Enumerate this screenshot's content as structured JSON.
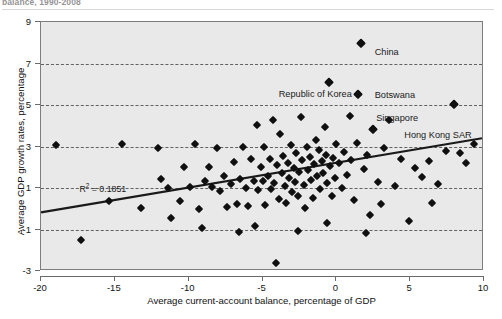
{
  "figure": {
    "title_partial": "balance, 1990-2008",
    "r2_label": "R",
    "r2_sup": "2",
    "r2_value": " = 0.1851"
  },
  "chart_data": {
    "type": "scatter",
    "title": "",
    "xlabel": "Average current-account balance, percentage of GDP",
    "ylabel": "Average GDP growth rates, percentage",
    "xlim": [
      -20,
      10
    ],
    "ylim": [
      -3,
      9
    ],
    "xticks": [
      -20,
      -15,
      -10,
      -5,
      0,
      5,
      10
    ],
    "xtick_labels": [
      "-20",
      "-15",
      "-10",
      "-5",
      "0",
      "5",
      "10"
    ],
    "yticks": [
      -3,
      -1,
      1,
      3,
      5,
      7,
      9
    ],
    "ytick_labels": [
      "-3",
      "-1",
      "1",
      "3",
      "5",
      "7",
      "9"
    ],
    "gridlines_y": [
      -1,
      1,
      3,
      5,
      7
    ],
    "grid": true,
    "grid_style": "dashed-horizontal",
    "legend": false,
    "marker": "diamond",
    "marker_color": "#101010",
    "plot_bg_color": "#e9e9e9",
    "trendline": {
      "type": "linear",
      "x_start": -20,
      "y_start": -0.25,
      "x_end": 10,
      "y_end": 3.35,
      "color": "#1a1a1a",
      "r_squared": 0.1851
    },
    "annotations": [
      {
        "text": "China",
        "x": 2.6,
        "y": 7.55,
        "point_x": 1.7,
        "point_y": 8.0
      },
      {
        "text": "Republic of Korea",
        "x": -3.9,
        "y": 5.55,
        "point_x": -0.5,
        "point_y": 6.1
      },
      {
        "text": "Botswana",
        "x": 2.6,
        "y": 5.5,
        "point_x": 1.5,
        "point_y": 5.55
      },
      {
        "text": "Singapore",
        "x": 2.7,
        "y": 4.35,
        "point_x": 2.5,
        "point_y": 3.85
      },
      {
        "text": "Hong Kong SAR",
        "x": 4.6,
        "y": 3.55,
        "point_x": 8.0,
        "point_y": 5.05
      }
    ],
    "points": [
      {
        "x": -19.0,
        "y": 3.05
      },
      {
        "x": -17.3,
        "y": -1.5
      },
      {
        "x": -14.5,
        "y": 3.1
      },
      {
        "x": -12.1,
        "y": 2.95
      },
      {
        "x": -11.9,
        "y": 1.45
      },
      {
        "x": -11.4,
        "y": 1.0
      },
      {
        "x": -11.2,
        "y": -0.45
      },
      {
        "x": -10.6,
        "y": 0.35
      },
      {
        "x": -10.3,
        "y": 2.0
      },
      {
        "x": -9.9,
        "y": 1.05
      },
      {
        "x": -9.6,
        "y": 3.1
      },
      {
        "x": -9.3,
        "y": 0.0
      },
      {
        "x": -8.9,
        "y": 1.35
      },
      {
        "x": -8.6,
        "y": 2.0
      },
      {
        "x": -8.4,
        "y": 1.05
      },
      {
        "x": -8.1,
        "y": 2.95
      },
      {
        "x": -7.9,
        "y": 0.85
      },
      {
        "x": -7.6,
        "y": 1.6
      },
      {
        "x": -7.4,
        "y": 0.1
      },
      {
        "x": -7.1,
        "y": 1.2
      },
      {
        "x": -6.9,
        "y": 2.25
      },
      {
        "x": -6.7,
        "y": 0.25
      },
      {
        "x": -6.5,
        "y": 1.45
      },
      {
        "x": -6.3,
        "y": 3.0
      },
      {
        "x": -6.1,
        "y": 1.0
      },
      {
        "x": -6.0,
        "y": 0.15
      },
      {
        "x": -5.8,
        "y": 2.4
      },
      {
        "x": -5.6,
        "y": 1.35
      },
      {
        "x": -5.4,
        "y": 4.05
      },
      {
        "x": -5.3,
        "y": 0.9
      },
      {
        "x": -5.1,
        "y": 2.0
      },
      {
        "x": -5.0,
        "y": 1.35
      },
      {
        "x": -4.9,
        "y": 3.0
      },
      {
        "x": -4.8,
        "y": 0.2
      },
      {
        "x": -4.6,
        "y": 1.6
      },
      {
        "x": -4.5,
        "y": 2.4
      },
      {
        "x": -4.4,
        "y": 0.95
      },
      {
        "x": -4.3,
        "y": 4.3
      },
      {
        "x": -4.2,
        "y": 1.25
      },
      {
        "x": -4.1,
        "y": -2.6
      },
      {
        "x": -4.0,
        "y": 2.1
      },
      {
        "x": -3.9,
        "y": 0.45
      },
      {
        "x": -3.8,
        "y": 3.6
      },
      {
        "x": -3.7,
        "y": 1.7
      },
      {
        "x": -3.6,
        "y": 2.55
      },
      {
        "x": -3.5,
        "y": 1.1
      },
      {
        "x": -3.4,
        "y": 0.3
      },
      {
        "x": -3.3,
        "y": 2.2
      },
      {
        "x": -3.2,
        "y": 1.5
      },
      {
        "x": -3.1,
        "y": 3.05
      },
      {
        "x": -3.0,
        "y": 0.8
      },
      {
        "x": -2.9,
        "y": 1.95
      },
      {
        "x": -2.8,
        "y": 1.3
      },
      {
        "x": -2.7,
        "y": 2.7
      },
      {
        "x": -2.6,
        "y": 0.6
      },
      {
        "x": -2.5,
        "y": 1.75
      },
      {
        "x": -2.4,
        "y": 4.4
      },
      {
        "x": -2.3,
        "y": 2.35
      },
      {
        "x": -2.2,
        "y": 1.15
      },
      {
        "x": -2.1,
        "y": 0.05
      },
      {
        "x": -2.0,
        "y": 3.0
      },
      {
        "x": -1.9,
        "y": 1.85
      },
      {
        "x": -1.8,
        "y": 2.5
      },
      {
        "x": -1.7,
        "y": 1.4
      },
      {
        "x": -1.6,
        "y": 0.5
      },
      {
        "x": -1.5,
        "y": 2.15
      },
      {
        "x": -1.4,
        "y": 3.3
      },
      {
        "x": -1.3,
        "y": 1.6
      },
      {
        "x": -1.2,
        "y": 2.85
      },
      {
        "x": -1.1,
        "y": 0.95
      },
      {
        "x": -1.0,
        "y": 2.3
      },
      {
        "x": -0.9,
        "y": 1.7
      },
      {
        "x": -0.8,
        "y": 3.95
      },
      {
        "x": -0.7,
        "y": 2.6
      },
      {
        "x": -0.6,
        "y": 1.25
      },
      {
        "x": -0.5,
        "y": 6.1
      },
      {
        "x": -0.4,
        "y": 2.05
      },
      {
        "x": -0.3,
        "y": 0.6
      },
      {
        "x": -0.2,
        "y": 2.45
      },
      {
        "x": -0.1,
        "y": 1.5
      },
      {
        "x": 0.0,
        "y": 3.1
      },
      {
        "x": 0.2,
        "y": 2.2
      },
      {
        "x": 0.4,
        "y": 1.0
      },
      {
        "x": 0.5,
        "y": 2.75
      },
      {
        "x": 0.7,
        "y": 1.65
      },
      {
        "x": 0.9,
        "y": 4.45
      },
      {
        "x": 1.0,
        "y": 2.35
      },
      {
        "x": 1.2,
        "y": 0.4
      },
      {
        "x": 1.4,
        "y": 3.15
      },
      {
        "x": 1.5,
        "y": 5.55
      },
      {
        "x": 1.7,
        "y": 8.0
      },
      {
        "x": 1.9,
        "y": 1.9
      },
      {
        "x": 2.1,
        "y": 2.6
      },
      {
        "x": 2.3,
        "y": -0.3
      },
      {
        "x": 2.5,
        "y": 3.85
      },
      {
        "x": 2.8,
        "y": 1.3
      },
      {
        "x": 3.2,
        "y": 2.95
      },
      {
        "x": 3.6,
        "y": 4.3
      },
      {
        "x": 4.0,
        "y": 1.1
      },
      {
        "x": 4.4,
        "y": 2.4
      },
      {
        "x": 4.9,
        "y": -0.6
      },
      {
        "x": 5.3,
        "y": 1.95
      },
      {
        "x": 5.8,
        "y": 1.55
      },
      {
        "x": 6.3,
        "y": 2.3
      },
      {
        "x": 6.9,
        "y": 1.2
      },
      {
        "x": 7.4,
        "y": 2.8
      },
      {
        "x": 8.0,
        "y": 5.05
      },
      {
        "x": 8.4,
        "y": 2.7
      },
      {
        "x": 8.8,
        "y": 2.2
      },
      {
        "x": 9.3,
        "y": 3.1
      },
      {
        "x": -15.4,
        "y": 0.35
      },
      {
        "x": -13.2,
        "y": 0.05
      },
      {
        "x": -6.6,
        "y": -1.1
      },
      {
        "x": -5.5,
        "y": -0.85
      },
      {
        "x": -2.6,
        "y": -1.05
      },
      {
        "x": 2.0,
        "y": -1.15
      },
      {
        "x": -9.1,
        "y": -0.95
      },
      {
        "x": 6.5,
        "y": 0.3
      },
      {
        "x": 3.0,
        "y": 0.25
      },
      {
        "x": -0.6,
        "y": -0.7
      }
    ]
  }
}
